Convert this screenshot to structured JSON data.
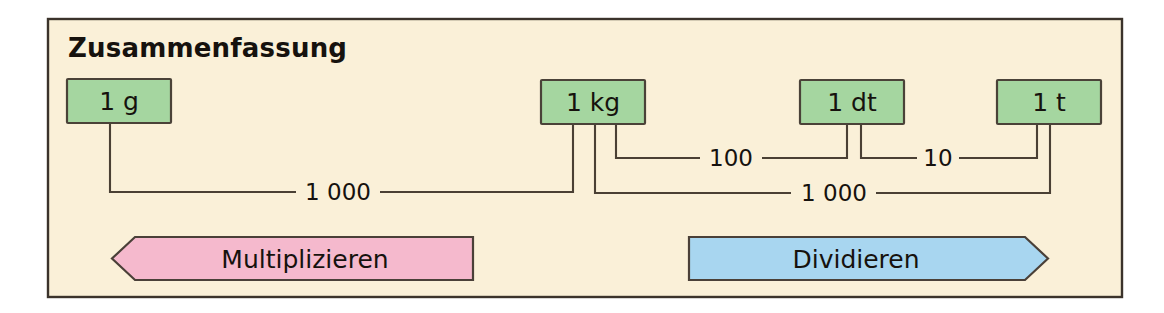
{
  "diagram": {
    "title": "Zusammenfassung",
    "units": [
      {
        "id": "gram",
        "label": "1 g"
      },
      {
        "id": "kilogram",
        "label": "1 kg"
      },
      {
        "id": "dezitonne",
        "label": "1 dt"
      },
      {
        "id": "tonne",
        "label": "1 t"
      }
    ],
    "conversions": [
      {
        "id": "g-to-kg",
        "from": "1 g",
        "to": "1 kg",
        "factor": "1 000"
      },
      {
        "id": "kg-to-dt",
        "from": "1 kg",
        "to": "1 dt",
        "factor": "100"
      },
      {
        "id": "dt-to-t",
        "from": "1 dt",
        "to": "1 t",
        "factor": "10"
      },
      {
        "id": "kg-to-t",
        "from": "1 kg",
        "to": "1 t",
        "factor": "1 000"
      }
    ],
    "banners": [
      {
        "id": "multiply",
        "label": "Multiplizieren",
        "direction": "left",
        "color": "#f5b9cd"
      },
      {
        "id": "divide",
        "label": "Dividieren",
        "direction": "right",
        "color": "#a8d6f0"
      }
    ],
    "colors": {
      "page_background": "#ffffff",
      "panel_background": "#faf0d8",
      "unit_box_fill": "#a5d6a0",
      "line": "#4a4034",
      "border": "#3b332b",
      "multiply_fill": "#f5b9cd",
      "divide_fill": "#a8d6f0",
      "text": "#16120e"
    }
  }
}
